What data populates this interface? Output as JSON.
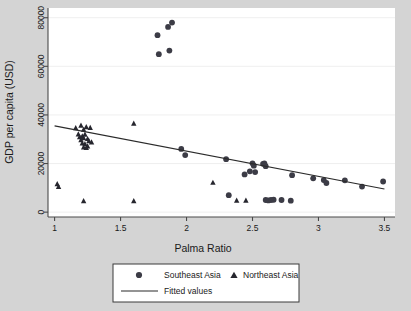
{
  "chart_data": {
    "type": "scatter",
    "title": "",
    "xlabel": "Palma Ratio",
    "ylabel": "GDP per capita (USD)",
    "xlim": [
      0.95,
      3.58
    ],
    "ylim": [
      -2000,
      84000
    ],
    "xticks": [
      "1",
      "1.5",
      "2",
      "2.5",
      "3",
      "3.5"
    ],
    "xtick_values": [
      1,
      1.5,
      2,
      2.5,
      3,
      3.5
    ],
    "yticks": [
      "0",
      "20000",
      "40000",
      "60000",
      "80000"
    ],
    "ytick_values": [
      0,
      20000,
      40000,
      60000,
      80000
    ],
    "grid": true,
    "grid_axis": "y",
    "legend_position": "below",
    "background_color": "#d4d4d4",
    "plot_background_color": "#ffffff",
    "marker_color": "#3c3c46",
    "line_color": "#2b2b2b",
    "series": [
      {
        "name": "Southeast Asia",
        "marker": "circle",
        "points": [
          [
            1.78,
            72800
          ],
          [
            1.79,
            65000
          ],
          [
            1.86,
            76200
          ],
          [
            1.87,
            66500
          ],
          [
            1.89,
            78000
          ],
          [
            1.96,
            26000
          ],
          [
            1.99,
            23500
          ],
          [
            2.3,
            21800
          ],
          [
            2.32,
            7000
          ],
          [
            2.44,
            15500
          ],
          [
            2.48,
            16800
          ],
          [
            2.5,
            20100
          ],
          [
            2.51,
            19100
          ],
          [
            2.52,
            16500
          ],
          [
            2.58,
            19900
          ],
          [
            2.59,
            20100
          ],
          [
            2.6,
            18900
          ],
          [
            2.6,
            5000
          ],
          [
            2.62,
            4800
          ],
          [
            2.64,
            5000
          ],
          [
            2.66,
            5100
          ],
          [
            2.72,
            5000
          ],
          [
            2.79,
            4700
          ],
          [
            2.8,
            15200
          ],
          [
            2.96,
            13900
          ],
          [
            3.04,
            13200
          ],
          [
            3.06,
            12000
          ],
          [
            3.2,
            13100
          ],
          [
            3.33,
            10500
          ],
          [
            3.49,
            12600
          ]
        ]
      },
      {
        "name": "Northeast Asia",
        "marker": "triangle",
        "points": [
          [
            1.02,
            11500
          ],
          [
            1.03,
            10400
          ],
          [
            1.16,
            34600
          ],
          [
            1.18,
            32000
          ],
          [
            1.19,
            30900
          ],
          [
            1.2,
            35600
          ],
          [
            1.2,
            29600
          ],
          [
            1.21,
            31200
          ],
          [
            1.21,
            28300
          ],
          [
            1.22,
            33900
          ],
          [
            1.22,
            30400
          ],
          [
            1.22,
            26600
          ],
          [
            1.23,
            31900
          ],
          [
            1.23,
            28000
          ],
          [
            1.24,
            35000
          ],
          [
            1.24,
            26400
          ],
          [
            1.25,
            30100
          ],
          [
            1.25,
            27100
          ],
          [
            1.26,
            29200
          ],
          [
            1.27,
            34700
          ],
          [
            1.28,
            28700
          ],
          [
            1.22,
            4500
          ],
          [
            1.6,
            36400
          ],
          [
            1.6,
            4500
          ],
          [
            2.2,
            12100
          ],
          [
            2.38,
            4700
          ],
          [
            2.45,
            4700
          ]
        ]
      }
    ],
    "fitted_line": {
      "name": "Fitted values",
      "x": [
        1.0,
        3.5
      ],
      "y": [
        35500,
        9500
      ],
      "slope": -10400,
      "intercept": 45900
    }
  },
  "legend": {
    "entries": [
      {
        "label": "Southeast Asia",
        "marker": "circle"
      },
      {
        "label": "Northeast Asia",
        "marker": "triangle"
      },
      {
        "label": "Fitted values",
        "marker": "line"
      }
    ]
  }
}
